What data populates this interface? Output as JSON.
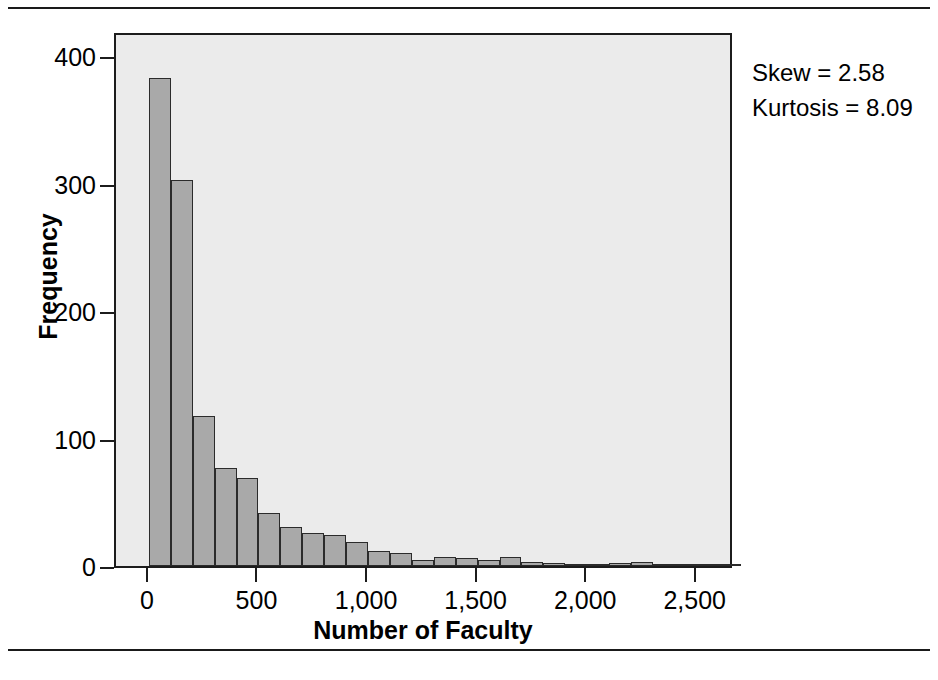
{
  "figure": {
    "has_top_rule": true,
    "has_bottom_rule": true,
    "background_color": "#ffffff",
    "plot_background_color": "#ebebeb",
    "bar_fill_color": "#a9a9a9",
    "bar_border_color": "#2b2b2b",
    "axis_color": "#1c1c1c"
  },
  "annotation": {
    "skew": "Skew = 2.58",
    "kurtosis": "Kurtosis = 8.09"
  },
  "chart_data": {
    "type": "bar",
    "title": "",
    "xlabel": "Number of Faculty",
    "ylabel": "Frequency",
    "xlim": [
      -150,
      2670
    ],
    "ylim": [
      0,
      420
    ],
    "grid": false,
    "legend": false,
    "bin_width": 100,
    "x_ticks": [
      0,
      500,
      1000,
      1500,
      2000,
      2500
    ],
    "x_tick_labels": [
      "0",
      "500",
      "1,000",
      "1,500",
      "2,000",
      "2,500"
    ],
    "y_ticks": [
      0,
      100,
      200,
      300,
      400
    ],
    "y_tick_labels": [
      "0",
      "100",
      "200",
      "300",
      "400"
    ],
    "bin_starts": [
      0,
      100,
      200,
      300,
      400,
      500,
      600,
      700,
      800,
      900,
      1000,
      1100,
      1200,
      1300,
      1400,
      1500,
      1600,
      1700,
      1800,
      1900,
      2000,
      2100,
      2200,
      2300,
      2400,
      2500,
      2600
    ],
    "values": [
      383,
      303,
      118,
      77,
      69,
      42,
      31,
      26,
      24,
      19,
      12,
      10,
      5,
      7,
      6,
      5,
      7,
      3,
      2,
      1,
      1,
      2,
      3,
      1,
      1,
      1,
      1
    ]
  }
}
